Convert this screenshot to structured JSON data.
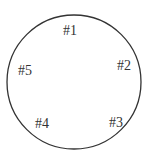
{
  "diagram": {
    "circle": {
      "cx": 74,
      "cy": 82,
      "r": 67,
      "stroke": "#333333"
    },
    "labels": [
      {
        "text": "#1",
        "x": 70,
        "y": 35
      },
      {
        "text": "#2",
        "x": 124,
        "y": 70
      },
      {
        "text": "#3",
        "x": 116,
        "y": 127
      },
      {
        "text": "#4",
        "x": 42,
        "y": 128
      },
      {
        "text": "#5",
        "x": 25,
        "y": 75
      }
    ]
  }
}
